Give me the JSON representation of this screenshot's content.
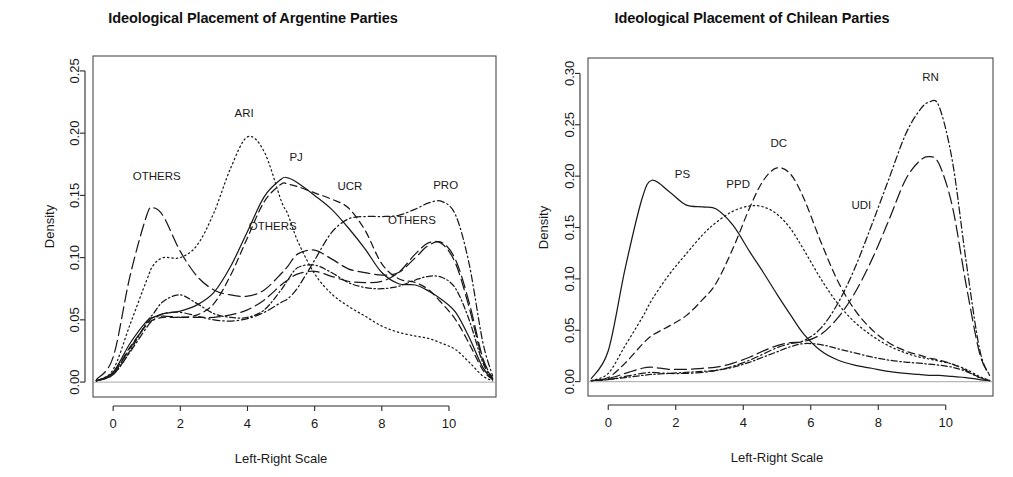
{
  "chart_data": [
    {
      "type": "line",
      "panel": "left",
      "title": "Ideological Placement of Argentine Parties",
      "xlabel": "Left-Right Scale",
      "ylabel": "Density",
      "xlim": [
        -0.6,
        11.4
      ],
      "ylim": [
        -0.012,
        0.262
      ],
      "xticks": [
        0,
        2,
        4,
        6,
        8,
        10
      ],
      "xticklabels": [
        "0",
        "2",
        "4",
        "6",
        "8",
        "10"
      ],
      "yticks": [
        0.0,
        0.05,
        0.1,
        0.15,
        0.2,
        0.25
      ],
      "yticklabels": [
        "0.00",
        "0.05",
        "0.10",
        "0.15",
        "0.20",
        "0.25"
      ],
      "grid": false,
      "legend": "inline-annotations",
      "x": [
        -0.5,
        0,
        0.5,
        1,
        1.2,
        1.5,
        2,
        2.5,
        3,
        3.5,
        4,
        4.5,
        5,
        5.2,
        5.5,
        6,
        6.5,
        7,
        7.5,
        8,
        8.5,
        9,
        9.4,
        9.8,
        10.2,
        10.6,
        11,
        11.3
      ],
      "series": [
        {
          "name": "PJ",
          "dash": "solid",
          "label": "PJ",
          "label_x": 5.45,
          "label_y": 0.178,
          "values": [
            0.001,
            0.008,
            0.031,
            0.049,
            0.052,
            0.055,
            0.057,
            0.062,
            0.072,
            0.093,
            0.121,
            0.149,
            0.163,
            0.164,
            0.16,
            0.15,
            0.139,
            0.124,
            0.107,
            0.088,
            0.079,
            0.078,
            0.073,
            0.066,
            0.056,
            0.036,
            0.012,
            0.002
          ]
        },
        {
          "name": "UCR",
          "dash": "dashed",
          "label": "UCR",
          "label_x": 7.05,
          "label_y": 0.154,
          "values": [
            0.001,
            0.007,
            0.028,
            0.046,
            0.05,
            0.052,
            0.052,
            0.054,
            0.063,
            0.086,
            0.116,
            0.145,
            0.159,
            0.159,
            0.157,
            0.152,
            0.147,
            0.14,
            0.122,
            0.095,
            0.083,
            0.08,
            0.074,
            0.063,
            0.05,
            0.031,
            0.01,
            0.002
          ]
        },
        {
          "name": "ARI",
          "dash": "dotted",
          "label": "ARI",
          "label_x": 3.9,
          "label_y": 0.213,
          "values": [
            0.001,
            0.01,
            0.046,
            0.082,
            0.094,
            0.1,
            0.1,
            0.11,
            0.136,
            0.172,
            0.197,
            0.185,
            0.146,
            0.135,
            0.113,
            0.087,
            0.071,
            0.061,
            0.053,
            0.045,
            0.04,
            0.037,
            0.035,
            0.031,
            0.026,
            0.016,
            0.005,
            0.001
          ]
        },
        {
          "name": "PRO",
          "dash": "dotdash",
          "label": "PRO",
          "label_x": 9.9,
          "label_y": 0.155,
          "values": [
            0.001,
            0.006,
            0.024,
            0.044,
            0.05,
            0.055,
            0.056,
            0.053,
            0.05,
            0.049,
            0.051,
            0.056,
            0.064,
            0.067,
            0.076,
            0.098,
            0.12,
            0.131,
            0.133,
            0.133,
            0.134,
            0.139,
            0.144,
            0.145,
            0.134,
            0.095,
            0.033,
            0.005
          ]
        },
        {
          "name": "OTHERS-left",
          "dash": "longdash",
          "label": "OTHERS",
          "label_x": 1.3,
          "label_y": 0.162,
          "values": [
            0.002,
            0.02,
            0.085,
            0.134,
            0.14,
            0.133,
            0.105,
            0.085,
            0.074,
            0.07,
            0.069,
            0.074,
            0.087,
            0.093,
            0.103,
            0.106,
            0.099,
            0.091,
            0.088,
            0.086,
            0.088,
            0.1,
            0.11,
            0.112,
            0.098,
            0.064,
            0.02,
            0.003
          ]
        },
        {
          "name": "OTHERS-mid",
          "dash": "dotdash2",
          "label": "OTHERS",
          "label_x": 4.75,
          "label_y": 0.122,
          "values": [
            0.001,
            0.006,
            0.025,
            0.048,
            0.055,
            0.065,
            0.07,
            0.063,
            0.055,
            0.052,
            0.052,
            0.058,
            0.074,
            0.082,
            0.092,
            0.094,
            0.088,
            0.08,
            0.076,
            0.075,
            0.077,
            0.082,
            0.085,
            0.084,
            0.075,
            0.05,
            0.016,
            0.002
          ]
        },
        {
          "name": "OTHERS-right",
          "dash": "longdash2",
          "label": "OTHERS",
          "label_x": 8.9,
          "label_y": 0.127,
          "values": [
            0.001,
            0.007,
            0.027,
            0.047,
            0.052,
            0.053,
            0.052,
            0.052,
            0.052,
            0.054,
            0.058,
            0.066,
            0.078,
            0.082,
            0.087,
            0.089,
            0.085,
            0.081,
            0.08,
            0.081,
            0.088,
            0.103,
            0.112,
            0.111,
            0.095,
            0.06,
            0.018,
            0.003
          ]
        }
      ]
    },
    {
      "type": "line",
      "panel": "right",
      "title": "Ideological Placement of Chilean Parties",
      "xlabel": "Left-Right Scale",
      "ylabel": "Density",
      "xlim": [
        -0.6,
        11.4
      ],
      "ylim": [
        -0.014,
        0.315
      ],
      "xticks": [
        0,
        2,
        4,
        6,
        8,
        10
      ],
      "xticklabels": [
        "0",
        "2",
        "4",
        "6",
        "8",
        "10"
      ],
      "yticks": [
        0.0,
        0.05,
        0.1,
        0.15,
        0.2,
        0.25,
        0.3
      ],
      "yticklabels": [
        "0.00",
        "0.05",
        "0.10",
        "0.15",
        "0.20",
        "0.25",
        "0.30"
      ],
      "grid": false,
      "legend": "inline-annotations",
      "x": [
        -0.5,
        0,
        0.5,
        1,
        1.3,
        1.8,
        2.3,
        2.8,
        3.2,
        3.7,
        4.2,
        4.6,
        5,
        5.4,
        5.8,
        6.3,
        6.8,
        7.3,
        7.8,
        8.3,
        8.8,
        9.2,
        9.5,
        9.8,
        10.2,
        10.6,
        11,
        11.3
      ],
      "series": [
        {
          "name": "PS",
          "dash": "solid",
          "label": "PS",
          "label_x": 2.2,
          "label_y": 0.198,
          "values": [
            0.003,
            0.03,
            0.11,
            0.178,
            0.196,
            0.185,
            0.172,
            0.17,
            0.168,
            0.152,
            0.126,
            0.106,
            0.085,
            0.065,
            0.046,
            0.03,
            0.021,
            0.016,
            0.013,
            0.01,
            0.008,
            0.007,
            0.006,
            0.006,
            0.005,
            0.004,
            0.002,
            0.001
          ]
        },
        {
          "name": "PPD",
          "dash": "dotted",
          "label": "PPD",
          "label_x": 3.85,
          "label_y": 0.188,
          "values": [
            0.001,
            0.008,
            0.035,
            0.062,
            0.08,
            0.104,
            0.124,
            0.143,
            0.155,
            0.166,
            0.171,
            0.17,
            0.163,
            0.149,
            0.128,
            0.1,
            0.076,
            0.058,
            0.045,
            0.035,
            0.028,
            0.024,
            0.022,
            0.02,
            0.017,
            0.012,
            0.005,
            0.001
          ]
        },
        {
          "name": "DC",
          "dash": "dashed",
          "label": "DC",
          "label_x": 5.05,
          "label_y": 0.228,
          "values": [
            0.001,
            0.004,
            0.018,
            0.036,
            0.045,
            0.054,
            0.064,
            0.08,
            0.096,
            0.13,
            0.17,
            0.196,
            0.208,
            0.202,
            0.178,
            0.136,
            0.098,
            0.07,
            0.051,
            0.038,
            0.03,
            0.026,
            0.023,
            0.021,
            0.017,
            0.011,
            0.004,
            0.001
          ]
        },
        {
          "name": "UDI",
          "dash": "longdash",
          "label": "UDI",
          "label_x": 7.5,
          "label_y": 0.168,
          "values": [
            0.001,
            0.003,
            0.008,
            0.013,
            0.014,
            0.012,
            0.012,
            0.013,
            0.014,
            0.018,
            0.024,
            0.03,
            0.035,
            0.038,
            0.039,
            0.046,
            0.062,
            0.086,
            0.118,
            0.156,
            0.196,
            0.214,
            0.219,
            0.212,
            0.17,
            0.095,
            0.028,
            0.006
          ]
        },
        {
          "name": "RN",
          "dash": "dotdash",
          "label": "RN",
          "label_x": 9.55,
          "label_y": 0.293,
          "values": [
            0.001,
            0.002,
            0.005,
            0.008,
            0.009,
            0.008,
            0.008,
            0.009,
            0.011,
            0.015,
            0.021,
            0.027,
            0.033,
            0.037,
            0.04,
            0.052,
            0.076,
            0.11,
            0.152,
            0.196,
            0.24,
            0.263,
            0.272,
            0.268,
            0.214,
            0.118,
            0.032,
            0.006
          ]
        },
        {
          "name": "OTHERS-flat",
          "dash": "dotdash2",
          "label": "",
          "label_x": null,
          "label_y": null,
          "values": [
            0.001,
            0.002,
            0.004,
            0.006,
            0.007,
            0.008,
            0.009,
            0.01,
            0.011,
            0.014,
            0.019,
            0.024,
            0.029,
            0.034,
            0.037,
            0.036,
            0.032,
            0.028,
            0.024,
            0.021,
            0.019,
            0.018,
            0.017,
            0.016,
            0.014,
            0.01,
            0.004,
            0.001
          ]
        }
      ]
    }
  ],
  "panels": [
    {
      "title": "Ideological Placement of Argentine Parties",
      "xlabel": "Left-Right Scale",
      "ylabel": "Density"
    },
    {
      "title": "Ideological Placement of Chilean Parties",
      "xlabel": "Left-Right Scale",
      "ylabel": "Density"
    }
  ],
  "colors": {
    "line": "#1a1a1a",
    "axis": "#2a2a2a",
    "baseline": "#b8b8b8",
    "background": "#ffffff"
  }
}
